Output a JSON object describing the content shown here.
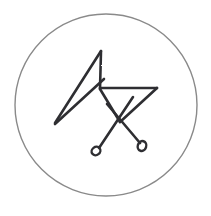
{
  "image": {
    "title": "Hand-drawn occult sigil in a circle",
    "kind": "ink-sketch",
    "width": 211,
    "height": 216,
    "background_color": "#ffffff"
  },
  "circle": {
    "name": "enclosing-circle",
    "center_x": 106,
    "center_y": 105,
    "radius": 91,
    "stroke_color": "#8a8a8a",
    "stroke_width": 1.4
  },
  "sigil": {
    "name": "sigil-glyph",
    "stroke_color": "#2f2f32",
    "stroke_width": 2.6,
    "description": "Narrow wedge from lower-left apex rising to a peak, a horizontal bar forming a flag to the right, and two crossing diagonals ending in small loops",
    "strokes": [
      {
        "name": "wedge-upper-edge",
        "d": "M 55 123 L 101 51"
      },
      {
        "name": "wedge-lower-edge",
        "d": "M 55 124 L 104 79"
      },
      {
        "name": "apex-descender",
        "d": "M 101 51 L 100 89"
      },
      {
        "name": "flag-top-bar",
        "d": "M 100 88 L 157 88"
      },
      {
        "name": "flag-right-diagonal",
        "d": "M 157 88 L 120 122"
      },
      {
        "name": "flag-lower-return",
        "d": "M 120 122 L 100 89"
      },
      {
        "name": "diagonal-to-left-loop",
        "d": "M 133 97 L 99 148"
      },
      {
        "name": "diagonal-to-right-loop",
        "d": "M 107 104 L 140 143"
      }
    ],
    "terminals": [
      {
        "name": "left-loop-terminal",
        "cx": 96,
        "cy": 151,
        "rx": 4.6,
        "ry": 4.0,
        "rotation": -38
      },
      {
        "name": "right-loop-terminal",
        "cx": 142,
        "cy": 146,
        "rx": 4.2,
        "ry": 5.0,
        "rotation": 18
      }
    ]
  },
  "alt_text": "A dark ink sigil drawn inside a thin gray circle on a white background"
}
